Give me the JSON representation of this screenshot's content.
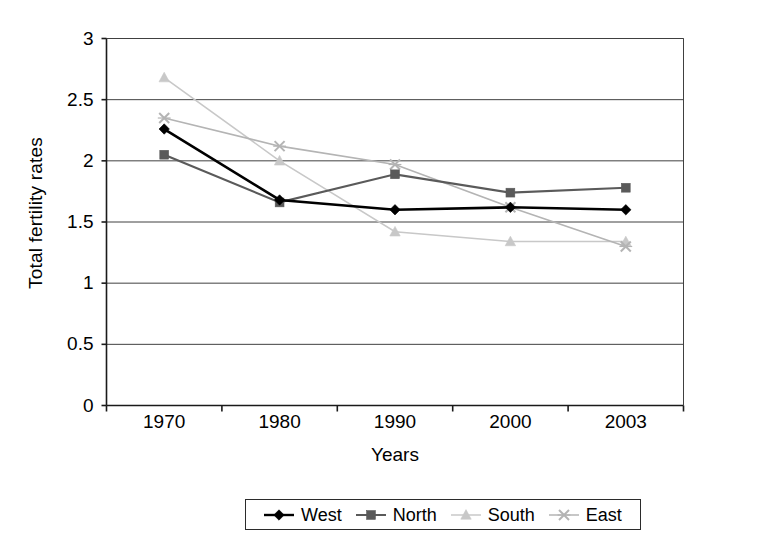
{
  "chart_data": {
    "type": "line",
    "title": "",
    "xlabel": "Years",
    "ylabel": "Total fertility rates",
    "categories": [
      "1970",
      "1980",
      "1990",
      "2000",
      "2003"
    ],
    "ylim": [
      0,
      3
    ],
    "ytick_labels": [
      "0",
      "0.5",
      "1",
      "1.5",
      "2",
      "2.5",
      "3"
    ],
    "ytick_values": [
      0,
      0.5,
      1,
      1.5,
      2,
      2.5,
      3
    ],
    "grid": "horizontal",
    "legend_position": "bottom",
    "series": [
      {
        "name": "West",
        "marker": "diamond",
        "color": "#000000",
        "values": [
          2.26,
          1.68,
          1.6,
          1.62,
          1.6
        ]
      },
      {
        "name": "North",
        "marker": "square",
        "color": "#5a5a5a",
        "values": [
          2.05,
          1.66,
          1.89,
          1.74,
          1.78
        ]
      },
      {
        "name": "South",
        "marker": "triangle",
        "color": "#c8c8c8",
        "values": [
          2.68,
          2.0,
          1.42,
          1.34,
          1.34
        ]
      },
      {
        "name": "East",
        "marker": "cross",
        "color": "#b4b4b4",
        "values": [
          2.35,
          2.12,
          1.97,
          1.62,
          1.3
        ]
      }
    ]
  },
  "axes": {
    "y_title": "Total fertility rates",
    "x_title": "Years"
  },
  "legend": {
    "entries": [
      {
        "label": "West"
      },
      {
        "label": "North"
      },
      {
        "label": "South"
      },
      {
        "label": "East"
      }
    ]
  }
}
